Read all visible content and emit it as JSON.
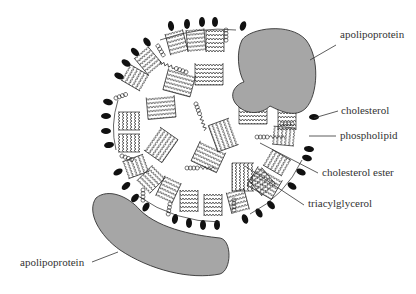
{
  "diagram": {
    "colors": {
      "background": "#ffffff",
      "protein_fill": "#a6a6a6",
      "protein_stroke": "#333333",
      "head_group": "#111111",
      "line": "#333333",
      "label_text": "#333333"
    },
    "labels": [
      {
        "id": "apolipoprotein_top",
        "text": "apolipoprotein",
        "x": 340,
        "y": 38
      },
      {
        "id": "cholesterol",
        "text": "cholesterol",
        "x": 341,
        "y": 114
      },
      {
        "id": "phospholipid",
        "text": "phospholipid",
        "x": 340,
        "y": 138
      },
      {
        "id": "cholesterol_ester",
        "text": "cholesterol ester",
        "x": 322,
        "y": 176
      },
      {
        "id": "triacylglycerol",
        "text": "triacylglycerol",
        "x": 308,
        "y": 206
      },
      {
        "id": "apolipoprotein_bottom",
        "text": "apolipoprotein",
        "x": 20,
        "y": 265
      }
    ],
    "components": [
      "apolipoprotein",
      "cholesterol",
      "phospholipid",
      "cholesterol ester",
      "triacylglycerol"
    ]
  }
}
